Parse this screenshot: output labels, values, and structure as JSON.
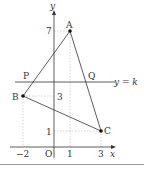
{
  "diagram": {
    "axes": {
      "x_label": "x",
      "y_label": "y",
      "origin_label": "O",
      "x_ticks": [
        "−2",
        "1",
        "3"
      ],
      "y_ticks": [
        "7",
        "3",
        "1"
      ]
    },
    "points": {
      "A": {
        "label": "A",
        "coords": [
          1,
          7
        ]
      },
      "B": {
        "label": "B",
        "coords": [
          -2,
          3
        ]
      },
      "C": {
        "label": "C",
        "coords": [
          3,
          1
        ]
      },
      "P": {
        "label": "P"
      },
      "Q": {
        "label": "Q"
      }
    },
    "line": {
      "label": "y = k"
    },
    "colors": {
      "stroke": "#333333",
      "guide": "#bbbbbb",
      "separator": "#999999"
    }
  }
}
